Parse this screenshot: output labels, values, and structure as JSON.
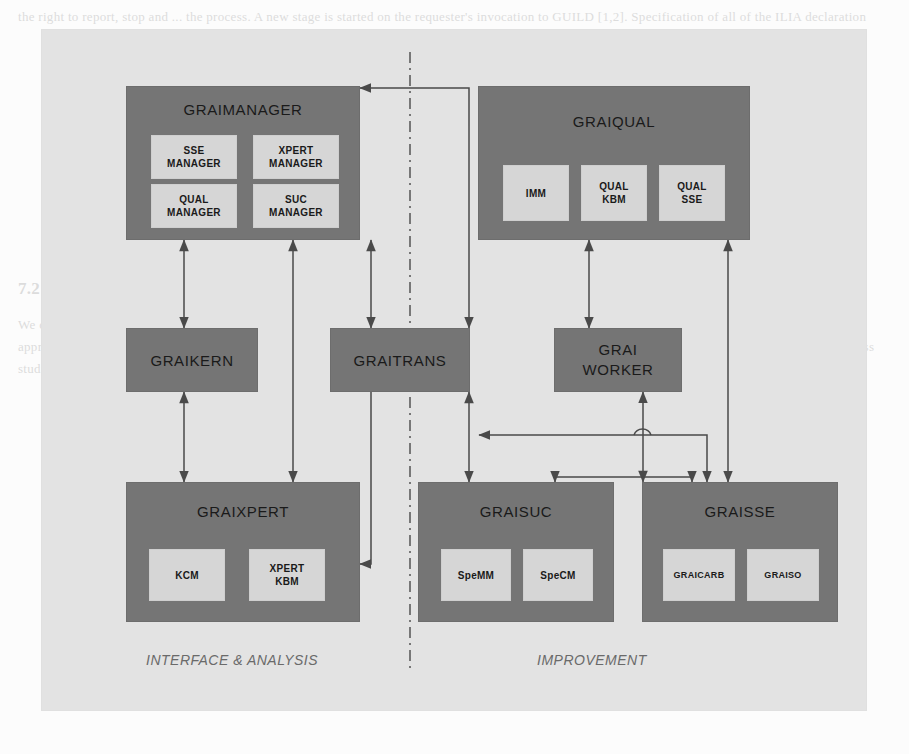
{
  "page": {
    "background_color": "#fcfcfc",
    "panel_color": "#e3e3e3",
    "box_color": "#757575",
    "subbox_color": "#d6d6d6",
    "line_color": "#4a4a4a",
    "ghost_text_top": "the right to report, stop and ... the process. A new stage is started on the requester's invocation to GUILD [1,2]. Specification of all of the ILIA declaration",
    "ghost_heading": "7.2 GRAI-based Quality Improvement Architecture",
    "ghost_body": "We consider the following architecture to support the quality management process and to guide the continuous improvement of the enterprise model. The approach integrates the analysis and interface components with the improvement components so that results can be fed back and re-used consistently across studies."
  },
  "diagram": {
    "divider": {
      "style": "dash-dot",
      "orientation": "vertical"
    },
    "zones": [
      {
        "id": "left",
        "label": "INTERFACE & ANALYSIS"
      },
      {
        "id": "right",
        "label": "IMPROVEMENT"
      }
    ],
    "boxes": [
      {
        "id": "graimanager",
        "title": "GRAIMANAGER",
        "children": [
          {
            "id": "sse-manager",
            "label": "SSE\nMANAGER"
          },
          {
            "id": "xpert-manager",
            "label": "XPERT\nMANAGER"
          },
          {
            "id": "qual-manager",
            "label": "QUAL\nMANAGER"
          },
          {
            "id": "suc-manager",
            "label": "SUC\nMANAGER"
          }
        ]
      },
      {
        "id": "graiqual",
        "title": "GRAIQUAL",
        "children": [
          {
            "id": "imm",
            "label": "IMM"
          },
          {
            "id": "qual-kbm",
            "label": "QUAL\nKBM"
          },
          {
            "id": "qual-sse",
            "label": "QUAL\nSSE"
          }
        ]
      },
      {
        "id": "graixpert",
        "title": "GRAIXPERT",
        "children": [
          {
            "id": "kcm",
            "label": "KCM"
          },
          {
            "id": "xpert-kbm",
            "label": "XPERT\nKBM"
          }
        ]
      },
      {
        "id": "graisuc",
        "title": "GRAISUC",
        "children": [
          {
            "id": "spemm",
            "label": "SpeMM"
          },
          {
            "id": "specm",
            "label": "SpeCM"
          }
        ]
      },
      {
        "id": "graisse",
        "title": "GRAISSE",
        "children": [
          {
            "id": "graicarb",
            "label": "GRAICARB"
          },
          {
            "id": "graiso",
            "label": "GRAISO"
          }
        ]
      }
    ],
    "bands": [
      {
        "id": "graikern",
        "label": "GRAIKERN"
      },
      {
        "id": "graitrans",
        "label": "GRAITRANS"
      },
      {
        "id": "graiworker",
        "label": "GRAI\nWORKER"
      }
    ],
    "connections": [
      {
        "from": "graimanager",
        "to": "graikern",
        "type": "bidirectional"
      },
      {
        "from": "graikern",
        "to": "graixpert",
        "type": "bidirectional"
      },
      {
        "from": "graimanager",
        "to": "graixpert",
        "type": "bidirectional"
      },
      {
        "from": "graimanager",
        "to": "graitrans",
        "type": "bidirectional"
      },
      {
        "from": "graiqual",
        "to": "graitrans",
        "type": "directed"
      },
      {
        "from": "graitrans",
        "to": "graixpert",
        "type": "directed"
      },
      {
        "from": "graitrans",
        "to": "graisuc",
        "type": "bidirectional"
      },
      {
        "from": "graiqual",
        "to": "graiworker",
        "type": "bidirectional"
      },
      {
        "from": "graiworker",
        "to": "graisse",
        "type": "bidirectional"
      },
      {
        "from": "graiqual",
        "to": "graisse",
        "type": "bidirectional"
      },
      {
        "from": "graiworker",
        "to": "graitrans",
        "type": "directed"
      },
      {
        "from": "graiworker",
        "to": "graisuc",
        "type": "directed"
      }
    ]
  }
}
